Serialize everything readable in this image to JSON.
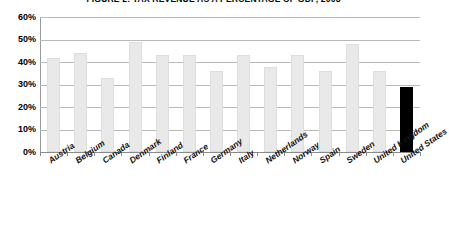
{
  "chart_data": {
    "type": "bar",
    "title": "FIGURE 2: TAX REVENUE AS A PERCENTAGE OF GDP, 2008",
    "xlabel": "",
    "ylabel": "",
    "ylim": [
      0,
      60
    ],
    "ytick_labels": [
      "60%",
      "50%",
      "40%",
      "30%",
      "20%",
      "10%",
      "0%"
    ],
    "ytick_values": [
      60,
      50,
      40,
      30,
      20,
      10,
      0
    ],
    "grid": true,
    "legend": "none",
    "value_suffix": "%",
    "categories": [
      "Austria",
      "Belgium",
      "Canada",
      "Denmark",
      "Finland",
      "France",
      "Germany",
      "Italy",
      "Netherlands",
      "Norway",
      "Spain",
      "Sweden",
      "United Kingdom",
      "United States"
    ],
    "values": [
      42,
      44,
      33,
      49,
      43,
      43,
      36,
      43,
      38,
      43,
      36,
      48,
      36,
      29
    ],
    "highlight_category": "United States",
    "highlight_color": "#000000",
    "bar_color": "#e9e9e9"
  }
}
